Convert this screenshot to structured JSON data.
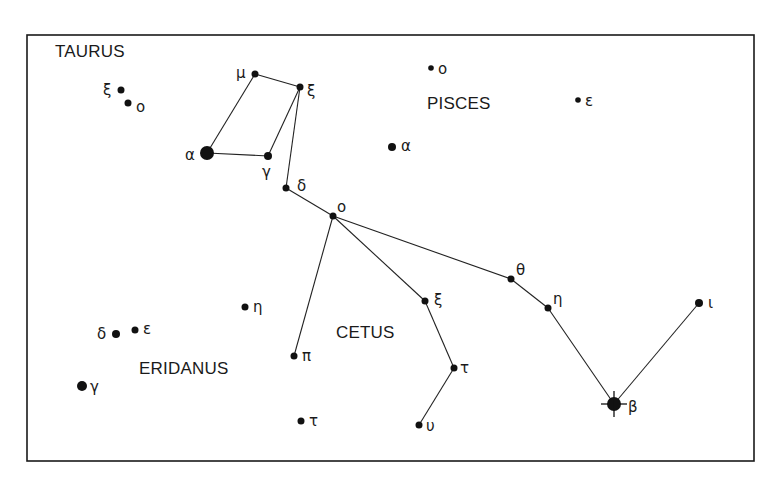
{
  "frame": {
    "x": 27,
    "y": 35,
    "w": 727,
    "h": 426
  },
  "constellations": [
    {
      "name": "TAURUS",
      "x": 55,
      "y": 57
    },
    {
      "name": "PISCES",
      "x": 427,
      "y": 109
    },
    {
      "name": "CETUS",
      "x": 336,
      "y": 338
    },
    {
      "name": "ERIDANUS",
      "x": 139,
      "y": 374
    }
  ],
  "stars": [
    {
      "id": "tau-xi-a",
      "label": "ξ",
      "x": 121,
      "y": 90,
      "r": 3.5,
      "lx": 103,
      "ly": 95
    },
    {
      "id": "tau-o",
      "label": "o",
      "x": 128,
      "y": 103,
      "r": 3.5,
      "lx": 136,
      "ly": 112
    },
    {
      "id": "tau-mu",
      "label": "μ",
      "x": 255,
      "y": 74,
      "r": 3.5,
      "lx": 236,
      "ly": 78
    },
    {
      "id": "tau-xi-b",
      "label": "ξ",
      "x": 300,
      "y": 87,
      "r": 3.5,
      "lx": 307,
      "ly": 96
    },
    {
      "id": "tau-alpha",
      "label": "α",
      "x": 207,
      "y": 153,
      "r": 7,
      "lx": 185,
      "ly": 160
    },
    {
      "id": "tau-gamma",
      "label": "γ",
      "x": 268,
      "y": 156,
      "r": 4,
      "lx": 262,
      "ly": 177
    },
    {
      "id": "tau-delta",
      "label": "δ",
      "x": 286,
      "y": 188,
      "r": 3.5,
      "lx": 297,
      "ly": 191
    },
    {
      "id": "psc-o",
      "label": "o",
      "x": 431,
      "y": 68,
      "r": 2.8,
      "lx": 438,
      "ly": 74
    },
    {
      "id": "psc-epsilon",
      "label": "ε",
      "x": 578,
      "y": 100,
      "r": 2.8,
      "lx": 585,
      "ly": 106
    },
    {
      "id": "psc-alpha",
      "label": "α",
      "x": 392,
      "y": 147,
      "r": 4,
      "lx": 401,
      "ly": 151
    },
    {
      "id": "cet-o",
      "label": "o",
      "x": 333,
      "y": 216,
      "r": 3.5,
      "lx": 337,
      "ly": 212
    },
    {
      "id": "cet-theta",
      "label": "θ",
      "x": 511,
      "y": 279,
      "r": 3.5,
      "lx": 516,
      "ly": 275
    },
    {
      "id": "cet-eta",
      "label": "η",
      "x": 548,
      "y": 308,
      "r": 3.5,
      "lx": 553,
      "ly": 304
    },
    {
      "id": "cet-beta",
      "label": "β",
      "x": 614,
      "y": 404,
      "r": 7,
      "lx": 628,
      "ly": 412,
      "spikes": true
    },
    {
      "id": "cet-iota",
      "label": "ι",
      "x": 699,
      "y": 303,
      "r": 4,
      "lx": 708,
      "ly": 308
    },
    {
      "id": "cet-xi",
      "label": "ξ",
      "x": 425,
      "y": 301,
      "r": 3.5,
      "lx": 434,
      "ly": 305
    },
    {
      "id": "cet-tau-a",
      "label": "τ",
      "x": 454,
      "y": 368,
      "r": 3.5,
      "lx": 460,
      "ly": 373
    },
    {
      "id": "cet-upsilon",
      "label": "υ",
      "x": 419,
      "y": 425,
      "r": 3.5,
      "lx": 426,
      "ly": 431
    },
    {
      "id": "cet-pi",
      "label": "π",
      "x": 294,
      "y": 356,
      "r": 3.5,
      "lx": 302,
      "ly": 361
    },
    {
      "id": "cet-tau-b",
      "label": "τ",
      "x": 301,
      "y": 421,
      "r": 3.5,
      "lx": 309,
      "ly": 426
    },
    {
      "id": "eri-eta",
      "label": "η",
      "x": 245,
      "y": 307,
      "r": 3.5,
      "lx": 253,
      "ly": 312
    },
    {
      "id": "eri-delta",
      "label": "δ",
      "x": 116,
      "y": 334,
      "r": 4,
      "lx": 97,
      "ly": 339
    },
    {
      "id": "eri-epsilon",
      "label": "ε",
      "x": 135,
      "y": 330,
      "r": 3.5,
      "lx": 143,
      "ly": 334
    },
    {
      "id": "eri-gamma",
      "label": "γ",
      "x": 82,
      "y": 386,
      "r": 5,
      "lx": 90,
      "ly": 392
    }
  ],
  "lines": [
    [
      "tau-alpha",
      "tau-mu"
    ],
    [
      "tau-mu",
      "tau-xi-b"
    ],
    [
      "tau-xi-b",
      "tau-gamma"
    ],
    [
      "tau-alpha",
      "tau-gamma"
    ],
    [
      "tau-xi-b",
      "tau-delta"
    ],
    [
      "tau-delta",
      "cet-o"
    ],
    [
      "cet-o",
      "cet-theta"
    ],
    [
      "cet-theta",
      "cet-eta"
    ],
    [
      "cet-eta",
      "cet-beta"
    ],
    [
      "cet-beta",
      "cet-iota"
    ],
    [
      "cet-o",
      "cet-xi"
    ],
    [
      "cet-xi",
      "cet-tau-a"
    ],
    [
      "cet-tau-a",
      "cet-upsilon"
    ],
    [
      "cet-o",
      "cet-pi"
    ]
  ]
}
